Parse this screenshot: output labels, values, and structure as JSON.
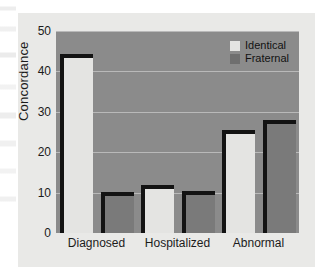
{
  "chart_data": {
    "type": "bar",
    "title": "",
    "xlabel": "",
    "ylabel": "Concordance",
    "categories": [
      "Diagnosed",
      "Hospitalized",
      "Abnormal"
    ],
    "series": [
      {
        "name": "Identical",
        "values": [
          44.3,
          12.0,
          25.5
        ],
        "color": "#e4e4e2"
      },
      {
        "name": "Fraternal",
        "values": [
          10.1,
          10.5,
          28.0
        ],
        "color": "#7a7a7a"
      }
    ],
    "ylim": [
      0,
      50
    ],
    "yticks": [
      0,
      10,
      20,
      30,
      40,
      50
    ],
    "ytick_labels": [
      "0",
      "10",
      "20",
      "30",
      "40",
      "50"
    ],
    "grid": true,
    "grid_axis": "y",
    "legend_position": "top-right",
    "plot_background": "#8b8b8b",
    "figure_background": "#e9e9e7",
    "bar_outline_color": "#131313"
  },
  "legend": {
    "entries": [
      {
        "label": "Identical"
      },
      {
        "label": "Fraternal"
      }
    ]
  },
  "axes": {
    "y_title": "Concordance"
  }
}
